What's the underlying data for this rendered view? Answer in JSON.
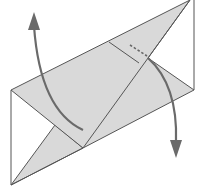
{
  "diagram": {
    "type": "origami-fold-step",
    "colors": {
      "background": "#ffffff",
      "paper_fill": "#d9d9d9",
      "paper_stroke": "#555555",
      "arrow": "#6a6a6a"
    },
    "elements": [
      {
        "name": "outer-square-outline",
        "kind": "outline"
      },
      {
        "name": "shaded-parallelogram-flap",
        "kind": "paper-layer"
      },
      {
        "name": "lower-triangle-flap",
        "kind": "paper-layer"
      },
      {
        "name": "crease-line",
        "kind": "crease"
      },
      {
        "name": "dashed-hidden-line",
        "kind": "hidden-edge"
      },
      {
        "name": "fold-arrow-up",
        "kind": "arrow",
        "direction": "up-left"
      },
      {
        "name": "fold-arrow-down",
        "kind": "arrow",
        "direction": "down-right"
      }
    ]
  }
}
